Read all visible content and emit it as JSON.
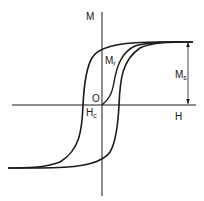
{
  "diagram": {
    "type": "hysteresis-loop",
    "axes": {
      "vertical_label": "M",
      "horizontal_label": "H"
    },
    "labels": {
      "origin": "O",
      "remanence_main": "M",
      "remanence_sub": "r",
      "coercivity_main": "H",
      "coercivity_sub": "c",
      "saturation_main": "M",
      "saturation_sub": "s"
    },
    "colors": {
      "line": "#1a1a1a",
      "background": "#ffffff"
    }
  }
}
